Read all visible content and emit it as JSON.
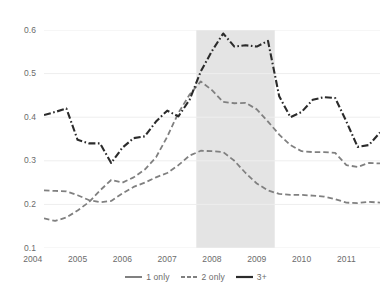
{
  "chart_data": {
    "type": "line",
    "title": "",
    "subtitle": "",
    "xlabel": "",
    "ylabel": "",
    "xlim": [
      2004.25,
      2011.75
    ],
    "ylim": [
      0.1,
      0.6
    ],
    "grid": true,
    "grid_axis": "y",
    "legend_position": "bottom",
    "x_tick_labels": [
      "2004",
      "2005",
      "2006",
      "2007",
      "2008",
      "2009",
      "2010",
      "2011"
    ],
    "x_tick_values": [
      2004,
      2005,
      2006,
      2007,
      2008,
      2009,
      2010,
      2011
    ],
    "y_tick_labels": [
      "0.1",
      "0.2",
      "0.3",
      "0.4",
      "0.5",
      "0.6"
    ],
    "y_tick_values": [
      0.1,
      0.2,
      0.3,
      0.4,
      0.5,
      0.6
    ],
    "x": [
      2004.25,
      2004.5,
      2004.75,
      2005.0,
      2005.25,
      2005.5,
      2005.75,
      2006.0,
      2006.25,
      2006.5,
      2006.75,
      2007.0,
      2007.25,
      2007.5,
      2007.75,
      2008.0,
      2008.25,
      2008.5,
      2008.75,
      2009.0,
      2009.25,
      2009.5,
      2009.75,
      2010.0,
      2010.25,
      2010.5,
      2010.75,
      2011.0,
      2011.25,
      2011.5,
      2011.75
    ],
    "series": [
      {
        "name": "1 only",
        "color": "#808080",
        "linestyle": "dashed",
        "values": [
          0.232,
          0.231,
          0.23,
          0.221,
          0.21,
          0.205,
          0.208,
          0.225,
          0.24,
          0.25,
          0.262,
          0.272,
          0.29,
          0.312,
          0.323,
          0.322,
          0.32,
          0.3,
          0.272,
          0.248,
          0.232,
          0.224,
          0.222,
          0.222,
          0.22,
          0.218,
          0.212,
          0.204,
          0.203,
          0.206,
          0.204
        ]
      },
      {
        "name": "2 only",
        "color": "#808080",
        "linestyle": "dashed",
        "values": [
          0.168,
          0.162,
          0.17,
          0.186,
          0.205,
          0.232,
          0.256,
          0.25,
          0.262,
          0.28,
          0.308,
          0.355,
          0.41,
          0.452,
          0.482,
          0.462,
          0.435,
          0.432,
          0.433,
          0.418,
          0.39,
          0.36,
          0.336,
          0.322,
          0.32,
          0.32,
          0.318,
          0.29,
          0.286,
          0.295,
          0.294
        ]
      },
      {
        "name": "3+",
        "color": "#2b2b2b",
        "linestyle": "dashdot",
        "values": [
          0.405,
          0.412,
          0.42,
          0.348,
          0.34,
          0.34,
          0.295,
          0.33,
          0.352,
          0.356,
          0.39,
          0.415,
          0.402,
          0.44,
          0.505,
          0.552,
          0.592,
          0.562,
          0.565,
          0.562,
          0.575,
          0.6,
          0.618,
          0.598,
          0.585,
          0.56,
          0.545,
          0.498,
          0.478,
          0.445,
          0.42
        ]
      }
    ],
    "series_tail": {
      "note": "",
      "x": [
        2009.5,
        2009.75,
        2010.0,
        2010.25,
        2010.5,
        2010.75,
        2011.0,
        2011.25,
        2011.5,
        2011.75
      ],
      "3+": [
        0.448,
        0.4,
        0.412,
        0.44,
        0.446,
        0.444,
        0.39,
        0.332,
        0.336,
        0.365
      ]
    },
    "shaded_regions": [
      {
        "name": "recession-band",
        "x_start": 2007.65,
        "x_end": 2009.4,
        "color": "#e4e4e4",
        "label": ""
      }
    ]
  },
  "legend": {
    "items": [
      {
        "label": "1 only",
        "color": "#808080",
        "dash": "6,0"
      },
      {
        "label": "2 only",
        "color": "#808080",
        "dash": "4,2"
      },
      {
        "label": "3+",
        "color": "#2b2b2b",
        "dash": "6,0"
      }
    ]
  },
  "colors": {
    "background": "#ffffff",
    "gridline": "#eeeeee",
    "axis_text": "#6b6b6b",
    "band": "#e4e4e4",
    "series_light": "#808080",
    "series_dark": "#2b2b2b"
  }
}
